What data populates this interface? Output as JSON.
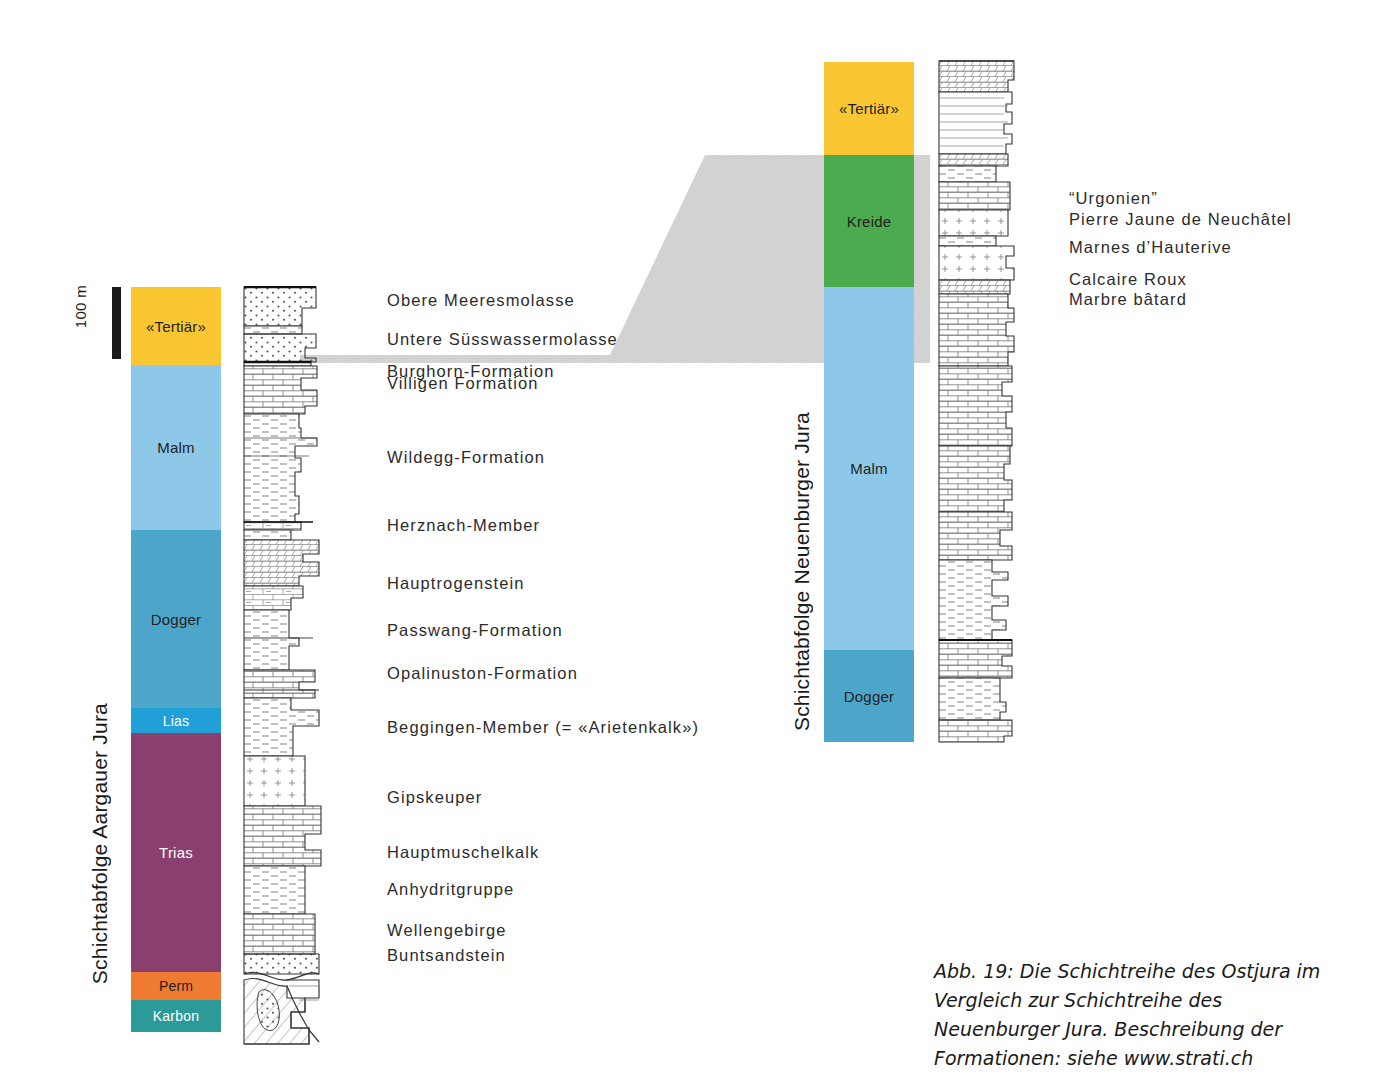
{
  "figure": {
    "caption": "Abb. 19: Die Schichtreihe des Ostjura im Vergleich zur Schichtreihe des Neuenburger Jura. Beschreibung der Formationen: siehe www.strati.ch"
  },
  "scale": {
    "label": "100 m",
    "bar_height_px": 72
  },
  "left_column": {
    "title": "Schichtabfolge Aargauer Jura",
    "units": [
      {
        "label": "«Tertiär»",
        "color": "#fac733",
        "text_color": "#231f20",
        "top": 287,
        "height": 78
      },
      {
        "label": "Malm",
        "color": "#8dc8e8",
        "text_color": "#231f20",
        "top": 365,
        "height": 165
      },
      {
        "label": "Dogger",
        "color": "#4ba6c9",
        "text_color": "#231f20",
        "top": 530,
        "height": 178
      },
      {
        "label": "Lias",
        "color": "#21a0d8",
        "text_color": "#ffffff",
        "top": 708,
        "height": 25
      },
      {
        "label": "Trias",
        "color": "#8b3f6e",
        "text_color": "#ffffff",
        "top": 733,
        "height": 239
      },
      {
        "label": "Perm",
        "color": "#ef7b33",
        "text_color": "#231f20",
        "top": 972,
        "height": 28
      },
      {
        "label": "Karbon",
        "color": "#2d9a9a",
        "text_color": "#ffffff",
        "top": 1000,
        "height": 32
      }
    ]
  },
  "right_column": {
    "title": "Schichtabfolge Neuenburger Jura",
    "units": [
      {
        "label": "«Tertiär»",
        "color": "#fac733",
        "text_color": "#231f20",
        "top": 62,
        "height": 93
      },
      {
        "label": "Kreide",
        "color": "#4cab4e",
        "text_color": "#231f20",
        "top": 155,
        "height": 132
      },
      {
        "label": "Malm",
        "color": "#8dc8e8",
        "text_color": "#231f20",
        "top": 287,
        "height": 363
      },
      {
        "label": "Dogger",
        "color": "#4ba6c9",
        "text_color": "#231f20",
        "top": 650,
        "height": 92
      }
    ]
  },
  "centre_labels": [
    {
      "text": "Obere Meeresmolasse",
      "top": 291
    },
    {
      "text": "Untere Süsswassermolasse",
      "top": 330
    },
    {
      "text": "Burghorn-Formation",
      "top": 362
    },
    {
      "text": "Villigen Formation",
      "top": 374
    },
    {
      "text": "Wildegg-Formation",
      "top": 448
    },
    {
      "text": "Herznach-Member",
      "top": 516
    },
    {
      "text": "Hauptrogenstein",
      "top": 574
    },
    {
      "text": "Passwang-Formation",
      "top": 621
    },
    {
      "text": "Opalinuston-Formation",
      "top": 664
    },
    {
      "text": "Beggingen-Member (= «Arietenkalk»)",
      "top": 718
    },
    {
      "text": "Gipskeuper",
      "top": 788
    },
    {
      "text": "Hauptmuschelkalk",
      "top": 843
    },
    {
      "text": "Anhydritgruppe",
      "top": 880
    },
    {
      "text": "Wellengebirge",
      "top": 921
    },
    {
      "text": "Buntsandstein",
      "top": 946
    }
  ],
  "right_labels": [
    {
      "text": "“Urgonien”",
      "top": 187
    },
    {
      "text": "Pierre Jaune de Neuchâtel",
      "top": 208
    },
    {
      "text": "Marnes d’Hauterive",
      "top": 236
    },
    {
      "text": "Calcaire Roux",
      "top": 268
    },
    {
      "text": "Marbre bâtard",
      "top": 288
    }
  ],
  "colors": {
    "tertiaer": "#fac733",
    "kreide": "#4cab4e",
    "malm": "#8dc8e8",
    "dogger": "#4ba6c9",
    "lias": "#21a0d8",
    "trias": "#8b3f6e",
    "perm": "#ef7b33",
    "karbon": "#2d9a9a",
    "correlation_wedge": "#d4d4d4",
    "text": "#231f20"
  }
}
